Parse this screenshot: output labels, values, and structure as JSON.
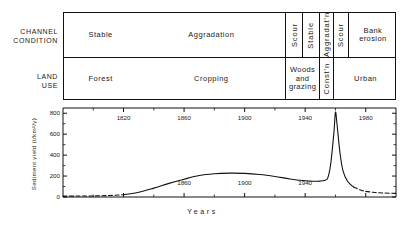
{
  "figure": {
    "row_captions": {
      "channel_condition": "CHANNEL\nCONDITION",
      "channel_condition_line1": "CHANNEL",
      "channel_condition_line2": "CONDITION",
      "land_use_line1": "LAND",
      "land_use_line2": "USE"
    }
  },
  "channel_condition": {
    "cells": [
      {
        "label": "Stable",
        "orientation": "horizontal",
        "start": 0.0,
        "end": 0.22
      },
      {
        "label": "Aggradation",
        "orientation": "horizontal",
        "start": 0.22,
        "end": 0.665
      },
      {
        "label": "Scour",
        "orientation": "vertical",
        "start": 0.665,
        "end": 0.715
      },
      {
        "label": "Stable",
        "orientation": "vertical",
        "start": 0.715,
        "end": 0.765
      },
      {
        "label": "Aggradat'n",
        "orientation": "vertical",
        "start": 0.765,
        "end": 0.808
      },
      {
        "label": "Scour",
        "orientation": "vertical",
        "start": 0.808,
        "end": 0.852
      },
      {
        "label": "Bank erosion",
        "orientation": "horizontal",
        "start": 0.852,
        "end": 1.0
      }
    ]
  },
  "land_use": {
    "cells": [
      {
        "label": "Forest",
        "orientation": "horizontal",
        "start": 0.0,
        "end": 0.22
      },
      {
        "label": "Cropping",
        "orientation": "horizontal",
        "start": 0.22,
        "end": 0.665
      },
      {
        "label": "Woods and grazing",
        "orientation": "horizontal",
        "start": 0.665,
        "end": 0.765
      },
      {
        "label": "Const'n",
        "orientation": "vertical",
        "start": 0.765,
        "end": 0.808
      },
      {
        "label": "Urban",
        "orientation": "horizontal",
        "start": 0.808,
        "end": 1.0
      }
    ]
  },
  "chart_data": {
    "type": "line",
    "title": "",
    "xlabel": "Years",
    "ylabel": "Sediment yield (t/km²/y)",
    "xlim": [
      1780,
      2000
    ],
    "ylim": [
      0,
      850
    ],
    "yticks": [
      0,
      200,
      400,
      600,
      800
    ],
    "xticks_major": [
      1820,
      1860,
      1900,
      1940,
      1980
    ],
    "xticks_minor": [
      1800,
      1840,
      1880,
      1920,
      1960,
      2000
    ],
    "xtick_labels_inner": [
      1860,
      1900,
      1940
    ],
    "grid": false,
    "legend": null,
    "line_color": "#111111",
    "series": [
      {
        "name": "Sediment yield",
        "style_segments": [
          {
            "style": "dashed",
            "x_start": 1780,
            "x_end": 1820
          },
          {
            "style": "solid",
            "x_start": 1820,
            "x_end": 1972
          },
          {
            "style": "dashed",
            "x_start": 1972,
            "x_end": 2000
          }
        ],
        "points": [
          {
            "x": 1780,
            "y": 8
          },
          {
            "x": 1790,
            "y": 9
          },
          {
            "x": 1800,
            "y": 10
          },
          {
            "x": 1810,
            "y": 14
          },
          {
            "x": 1820,
            "y": 22
          },
          {
            "x": 1830,
            "y": 45
          },
          {
            "x": 1840,
            "y": 85
          },
          {
            "x": 1850,
            "y": 130
          },
          {
            "x": 1860,
            "y": 170
          },
          {
            "x": 1870,
            "y": 205
          },
          {
            "x": 1880,
            "y": 222
          },
          {
            "x": 1890,
            "y": 228
          },
          {
            "x": 1900,
            "y": 226
          },
          {
            "x": 1910,
            "y": 215
          },
          {
            "x": 1920,
            "y": 196
          },
          {
            "x": 1930,
            "y": 172
          },
          {
            "x": 1940,
            "y": 155
          },
          {
            "x": 1945,
            "y": 150
          },
          {
            "x": 1950,
            "y": 152
          },
          {
            "x": 1953,
            "y": 160
          },
          {
            "x": 1955,
            "y": 185
          },
          {
            "x": 1957,
            "y": 330
          },
          {
            "x": 1959,
            "y": 620
          },
          {
            "x": 1960,
            "y": 810
          },
          {
            "x": 1961,
            "y": 700
          },
          {
            "x": 1963,
            "y": 420
          },
          {
            "x": 1965,
            "y": 250
          },
          {
            "x": 1968,
            "y": 150
          },
          {
            "x": 1972,
            "y": 95
          },
          {
            "x": 1978,
            "y": 60
          },
          {
            "x": 1985,
            "y": 45
          },
          {
            "x": 1992,
            "y": 38
          },
          {
            "x": 2000,
            "y": 35
          }
        ]
      }
    ]
  }
}
